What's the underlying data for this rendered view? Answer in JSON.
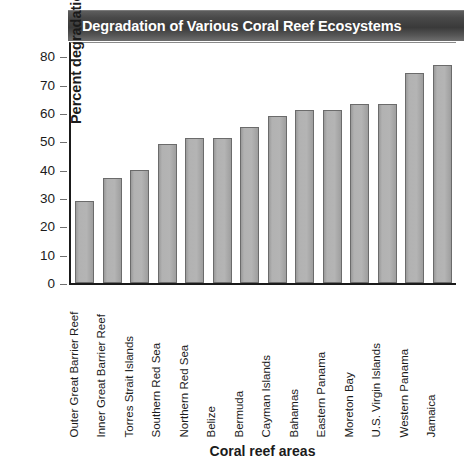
{
  "chart_data": {
    "type": "bar",
    "title": "Degradation of Various Coral Reef Ecosystems",
    "xlabel": "Coral reef areas",
    "ylabel": "Percent degradation",
    "categories": [
      "Outer Great Barrier Reef",
      "Inner Great Barrier Reef",
      "Torres Strait Islands",
      "Southern Red Sea",
      "Northern Red Sea",
      "Belize",
      "Bermuda",
      "Cayman Islands",
      "Bahamas",
      "Eastern Panama",
      "Moreton Bay",
      "U.S. Virgin Islands",
      "Western Panama",
      "Jamaica"
    ],
    "values": [
      29,
      37,
      40,
      49,
      51,
      51,
      55,
      59,
      61,
      61,
      63,
      63,
      74,
      77
    ],
    "ylim": [
      0,
      85
    ],
    "yticks": [
      0,
      10,
      20,
      30,
      40,
      50,
      60,
      70,
      80
    ],
    "ytick_labels": [
      "0",
      "10",
      "20",
      "30",
      "40",
      "50",
      "60",
      "70",
      "80"
    ],
    "grid": false,
    "legend": null,
    "bar_color": "#b0b0b0",
    "bar_edge_color": "#6b6b6b",
    "title_bar_color": "#3f3f3f",
    "title_text_color": "#ffffff",
    "text_color": "#1b1b1b"
  }
}
